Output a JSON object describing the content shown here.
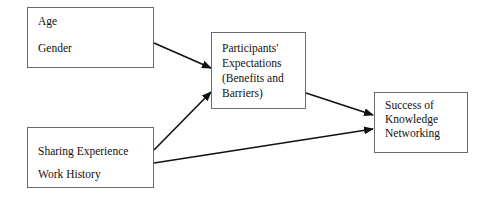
{
  "diagram": {
    "nodes": [
      {
        "id": "demographics",
        "lines": [
          "Age",
          "Gender"
        ]
      },
      {
        "id": "expectations",
        "lines": [
          "Participants'",
          "Expectations",
          "(Benefits and",
          "Barriers)"
        ]
      },
      {
        "id": "experience",
        "lines": [
          "Sharing Experience",
          "Work History"
        ]
      },
      {
        "id": "success",
        "lines": [
          "Success of",
          "Knowledge",
          "Networking"
        ]
      }
    ],
    "edges": [
      {
        "from": "demographics",
        "to": "expectations"
      },
      {
        "from": "experience",
        "to": "expectations"
      },
      {
        "from": "expectations",
        "to": "success"
      },
      {
        "from": "experience",
        "to": "success"
      }
    ]
  }
}
